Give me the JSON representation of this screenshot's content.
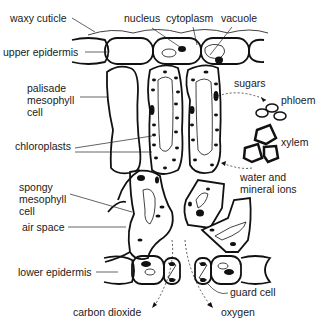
{
  "diagram": {
    "labels": {
      "waxy_cuticle": "waxy cuticle",
      "nucleus": "nucleus",
      "cytoplasm": "cytoplasm",
      "vacuole": "vacuole",
      "upper_epidermis": "upper epidermis",
      "palisade_mesophyll_cell": "palisade\nmesophyll\ncell",
      "chloroplasts": "chloroplasts",
      "sugars": "sugars",
      "phloem": "phloem",
      "xylem": "xylem",
      "water_and_mineral_ions": "water and\nmineral ions",
      "spongy_mesophyll_cell": "spongy\nmesophyll\ncell",
      "air_space": "air space",
      "lower_epidermis": "lower epidermis",
      "guard_cell": "guard cell",
      "carbon_dioxide": "carbon dioxide",
      "oxygen": "oxygen"
    },
    "colors": {
      "stroke": "#111111",
      "text": "#1a1a1a",
      "background": "#ffffff"
    }
  }
}
